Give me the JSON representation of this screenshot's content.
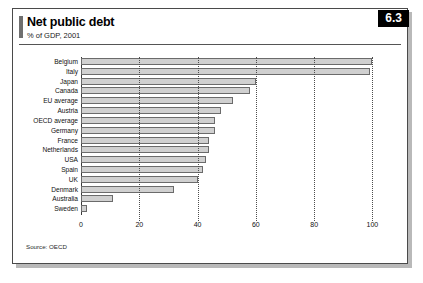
{
  "figure": {
    "number": "6.3",
    "title": "Net public debt",
    "subtitle": "% of GDP, 2001",
    "source": "Source: OECD"
  },
  "chart_data": {
    "type": "bar",
    "orientation": "horizontal",
    "title": "Net public debt",
    "subtitle": "% of GDP, 2001",
    "xlabel": "",
    "ylabel": "",
    "xlim": [
      0,
      105
    ],
    "grid": true,
    "legend": false,
    "xticks": [
      0,
      20,
      40,
      60,
      80,
      100
    ],
    "xtick_labels": [
      "0",
      "20",
      "40",
      "60",
      "80",
      "100"
    ],
    "categories": [
      "Belgium",
      "Italy",
      "Japan",
      "Canada",
      "EU average",
      "Austria",
      "OECD average",
      "Germany",
      "France",
      "Netherlands",
      "USA",
      "Spain",
      "UK",
      "Denmark",
      "Australia",
      "Sweden"
    ],
    "values": [
      100,
      99,
      60,
      58,
      52,
      48,
      46,
      46,
      44,
      44,
      43,
      42,
      40,
      32,
      11,
      2
    ],
    "bar_fill": "#d0d0d0",
    "bar_edge": "#6b6b6b"
  }
}
